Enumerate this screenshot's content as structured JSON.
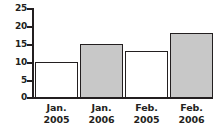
{
  "chart_data": {
    "type": "bar",
    "title": "",
    "xlabel": "",
    "ylabel": "",
    "categories": [
      "Jan. 2005",
      "Jan. 2006",
      "Feb. 2005",
      "Feb. 2006"
    ],
    "category_lines": [
      {
        "line1": "Jan.",
        "line2": "2005"
      },
      {
        "line1": "Jan.",
        "line2": "2006"
      },
      {
        "line1": "Feb.",
        "line2": "2005"
      },
      {
        "line1": "Feb.",
        "line2": "2006"
      }
    ],
    "values": [
      10,
      15,
      13,
      18
    ],
    "bar_styles": [
      "white",
      "gray",
      "white",
      "gray"
    ],
    "ylim": [
      0,
      25
    ],
    "yticks": [
      0,
      5,
      10,
      15,
      20,
      25
    ],
    "ytick_labels": [
      "0",
      "5",
      "10",
      "15",
      "20",
      "25"
    ],
    "grid": false,
    "legend": "none",
    "colors": {
      "axis": "#231f20",
      "bar_fill_gray": "#c8c8c8",
      "bar_fill_white": "#ffffff",
      "bar_outline": "#231f20",
      "background": "#ffffff"
    }
  }
}
